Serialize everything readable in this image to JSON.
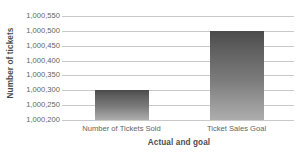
{
  "chart_data": {
    "type": "bar",
    "title": "",
    "xlabel": "Actual and goal",
    "ylabel": "Number of tickets",
    "categories": [
      "Number of Tickets Sold",
      "Ticket Sales Goal"
    ],
    "values": [
      1000300,
      1000500
    ],
    "ylim": [
      1000200,
      1000550
    ],
    "ytick_step": 50,
    "ytick_labels": [
      "1,000,550",
      "1,000,500",
      "1,000,450",
      "1,000,400",
      "1,000,350",
      "1,000,300",
      "1,000,250",
      "1,000,200"
    ],
    "ytick_values": [
      1000550,
      1000500,
      1000450,
      1000400,
      1000350,
      1000300,
      1000250,
      1000200
    ],
    "grid": true,
    "legend": false,
    "legend_position": "none",
    "bar_color_top": "#4a4a4a",
    "bar_color_bottom": "#adadad",
    "gridline_color": "#c9c9c9",
    "background_color": "#ffffff",
    "text_color": "#636363"
  }
}
